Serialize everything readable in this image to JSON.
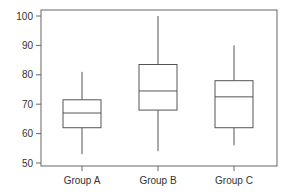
{
  "chart_data": {
    "type": "box",
    "title": "",
    "xlabel": "",
    "ylabel": "",
    "ylim": [
      48,
      101
    ],
    "yticks": [
      50,
      60,
      70,
      80,
      90,
      100
    ],
    "grid": false,
    "legend": null,
    "categories": [
      "Group A",
      "Group B",
      "Group C"
    ],
    "series": [
      {
        "name": "Group A",
        "whisker_low": 53,
        "q1": 62,
        "median": 67,
        "q3": 71.5,
        "whisker_high": 81
      },
      {
        "name": "Group B",
        "whisker_low": 54,
        "q1": 68,
        "median": 74.5,
        "q3": 83.5,
        "whisker_high": 100
      },
      {
        "name": "Group C",
        "whisker_low": 56,
        "q1": 62,
        "median": 72.5,
        "q3": 78,
        "whisker_high": 90
      }
    ]
  },
  "colors": {
    "line": "#555555",
    "text": "#333333",
    "background": "#ffffff"
  }
}
